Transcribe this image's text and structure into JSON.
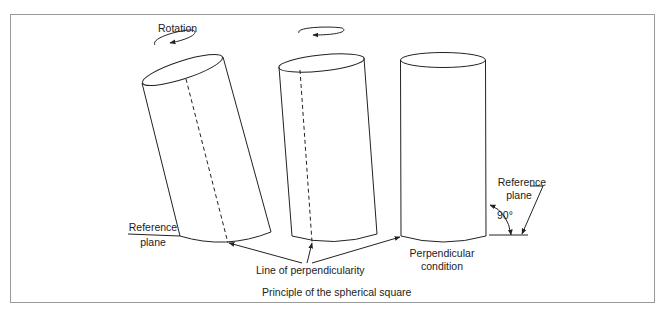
{
  "figure": {
    "caption": "Principle of the spherical square",
    "labels": {
      "rotation": "Rotation",
      "reference_plane_left_line1": "Reference",
      "reference_plane_left_line2": "plane",
      "line_of_perpendicularity": "Line of perpendicularity",
      "perpendicular_condition_line1": "Perpendicular",
      "perpendicular_condition_line2": "condition",
      "reference_plane_right_line1": "Reference",
      "reference_plane_right_line2": "plane",
      "angle": "90°"
    },
    "cylinders": [
      {
        "name": "tilted-cylinder",
        "state": "tilted",
        "has_rotation_label": true
      },
      {
        "name": "slightly-tilted-cylinder",
        "state": "slightly tilted",
        "has_rotation_label": false
      },
      {
        "name": "upright-cylinder",
        "state": "perpendicular",
        "has_rotation_label": false
      }
    ],
    "colors": {
      "line": "#222222",
      "frame": "#9a9a9a",
      "background": "#ffffff"
    }
  }
}
